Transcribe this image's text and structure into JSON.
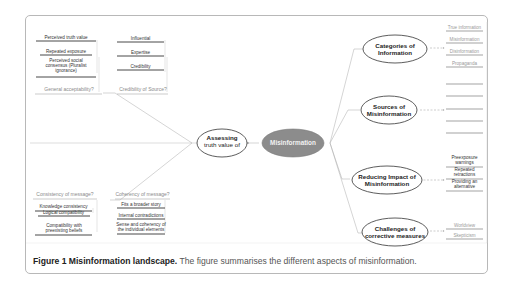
{
  "caption": {
    "label": "Figure 1 Misinformation landscape.",
    "text": " The figure summarises the different aspects of misinformation."
  },
  "center_node": {
    "label": "Misinformation",
    "fill": "#8c8c8c"
  },
  "left": {
    "node": {
      "label_line1": "Assessing",
      "label_line2": "truth value of"
    },
    "groups": [
      {
        "question": "General acceptability?",
        "items": [
          "Perceived truth value",
          "Repeated exposure",
          "Perceived social consensus (Pluralist ignorance)"
        ]
      },
      {
        "question": "Credibility of Source?",
        "items": [
          "Influential",
          "Expertise",
          "Credibility"
        ]
      },
      {
        "question": "Consistency of message?",
        "items": [
          "Knowledge consistency",
          "Logical compatibility",
          "Compatibility with preexisting beliefs"
        ]
      },
      {
        "question": "Coherency of message?",
        "items": [
          "Fits a broader story",
          "Internal contradictions",
          "Sense and coherency of the individual elements"
        ]
      }
    ]
  },
  "right": {
    "nodes": [
      {
        "label_line1": "Categories of",
        "label_line2": "Information",
        "items": [
          "True information",
          "Misinformation",
          "Disinformation",
          "Propaganda"
        ]
      },
      {
        "label_line1": "Sources of",
        "label_line2": "Misinformation",
        "items": [
          "",
          "",
          "",
          "",
          ""
        ]
      },
      {
        "label_line1": "Reducing Impact of",
        "label_line2": "Misinformation",
        "items": [
          "Preexposure warnings",
          "Repeated retractions",
          "Providing an alternative"
        ]
      },
      {
        "label_line1": "Challenges of",
        "label_line2": "corrective measures",
        "items": [
          "Worldview",
          "Skepticism"
        ]
      }
    ]
  }
}
